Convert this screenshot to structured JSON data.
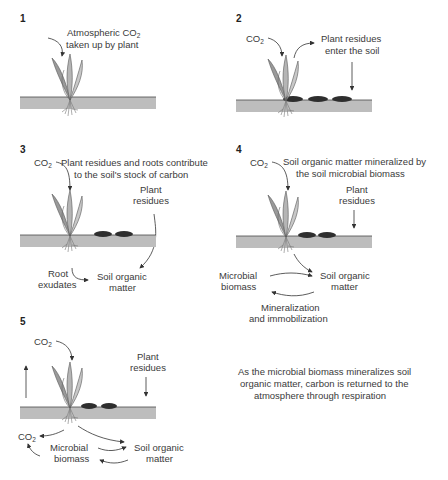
{
  "panels": [
    {
      "number": "1",
      "title_lines": [
        "Atmospheric CO",
        "taken up by plant"
      ],
      "title_sub": "2"
    },
    {
      "number": "2",
      "co2": "CO",
      "co2_sub": "2",
      "title_lines": [
        "Plant residues",
        "enter the soil"
      ]
    },
    {
      "number": "3",
      "co2": "CO",
      "co2_sub": "2",
      "title_lines": [
        "Plant residues and roots contribute",
        "to the soil's stock of carbon"
      ],
      "residues_lines": [
        "Plant",
        "residues"
      ],
      "root_lines": [
        "Root",
        "exudates"
      ],
      "som_lines": [
        "Soil organic",
        "matter"
      ]
    },
    {
      "number": "4",
      "co2": "CO",
      "co2_sub": "2",
      "title_lines": [
        "Soil organic matter mineralized by",
        "the soil microbial biomass"
      ],
      "residues_lines": [
        "Plant",
        "residues"
      ],
      "microbial_lines": [
        "Microbial",
        "biomass"
      ],
      "som_lines": [
        "Soil organic",
        "matter"
      ],
      "process_lines": [
        "Mineralization",
        "and immobilization"
      ]
    },
    {
      "number": "5",
      "co2": "CO",
      "co2_sub": "2",
      "residues_lines": [
        "Plant",
        "residues"
      ],
      "co2_out": "CO",
      "co2_out_sub": "2",
      "microbial_lines": [
        "Microbial",
        "biomass"
      ],
      "som_lines": [
        "Soil organic",
        "matter"
      ],
      "caption_lines": [
        "As the microbial biomass mineralizes soil",
        "organic matter, carbon is returned to the",
        "atmosphere through respiration"
      ]
    }
  ],
  "colors": {
    "soil": "#bdbdbd",
    "soil_edge": "#4a4a4a",
    "residue": "#2e2e2e",
    "leaf": "#a8a8a8",
    "text": "#3a3a3a"
  }
}
